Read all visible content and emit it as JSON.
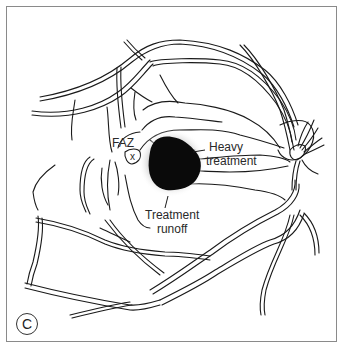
{
  "figure": {
    "panel_letter": "C"
  },
  "labels": {
    "faz": "FAZ",
    "fovea_marker": "x",
    "heavy_treatment_line1": "Heavy",
    "heavy_treatment_line2": "treatment",
    "runoff_line1": "Treatment",
    "runoff_line2": "runoff"
  },
  "colors": {
    "ink": "#1a1a1a",
    "treatment": "#0a0a0a",
    "runoff_halo": "#d9d9d9",
    "frame": "#8a8a8a"
  }
}
